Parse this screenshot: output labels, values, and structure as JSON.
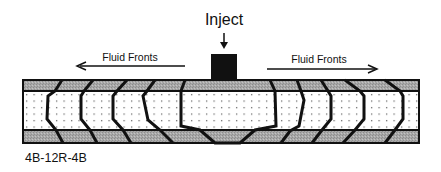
{
  "diagram": {
    "inject_label": "Inject",
    "left_arrow_label": "Fluid Fronts",
    "right_arrow_label": "Fluid Fronts",
    "caption": "4B-12R-4B",
    "layers": [
      {
        "name": "top-bounding-layer",
        "pattern": "gray-hatch"
      },
      {
        "name": "reservoir-layer",
        "pattern": "dotted"
      },
      {
        "name": "bottom-bounding-layer",
        "pattern": "gray-hatch"
      }
    ],
    "colors": {
      "band_gray": "#a4a4a4",
      "outline": "#111111",
      "dots": "#555555",
      "core_fill": "#ffffff"
    },
    "fronts_left": [
      [
        [
          62,
          80
        ],
        [
          55,
          91
        ],
        [
          48,
          96
        ],
        [
          47,
          119
        ],
        [
          56,
          130
        ],
        [
          63,
          143
        ]
      ],
      [
        [
          93,
          80
        ],
        [
          84,
          91
        ],
        [
          81,
          96
        ],
        [
          81,
          119
        ],
        [
          90,
          130
        ],
        [
          97,
          143
        ]
      ],
      [
        [
          127,
          80
        ],
        [
          117,
          91
        ],
        [
          113,
          96
        ],
        [
          113,
          119
        ],
        [
          123,
          130
        ],
        [
          131,
          143
        ]
      ],
      [
        [
          155,
          80
        ],
        [
          147,
          91
        ],
        [
          143,
          96
        ],
        [
          148,
          120
        ],
        [
          160,
          130
        ],
        [
          173,
          143
        ]
      ]
    ],
    "front_center": [
      [
        185,
        80
      ],
      [
        181,
        91
      ],
      [
        181,
        126
      ],
      [
        200,
        130
      ],
      [
        215,
        143
      ],
      [
        240,
        143
      ],
      [
        255,
        130
      ],
      [
        276,
        126
      ],
      [
        275,
        91
      ],
      [
        270,
        80
      ]
    ],
    "fronts_right": [
      [
        [
          297,
          80
        ],
        [
          301,
          91
        ],
        [
          304,
          100
        ],
        [
          299,
          126
        ],
        [
          290,
          131
        ],
        [
          281,
          143
        ]
      ],
      [
        [
          321,
          80
        ],
        [
          328,
          91
        ],
        [
          331,
          96
        ],
        [
          331,
          119
        ],
        [
          322,
          130
        ],
        [
          312,
          143
        ]
      ],
      [
        [
          345,
          80
        ],
        [
          360,
          91
        ],
        [
          364,
          96
        ],
        [
          364,
          119
        ],
        [
          355,
          130
        ],
        [
          343,
          143
        ]
      ],
      [
        [
          385,
          80
        ],
        [
          400,
          91
        ],
        [
          403,
          96
        ],
        [
          403,
          119
        ],
        [
          395,
          130
        ],
        [
          385,
          143
        ]
      ]
    ]
  }
}
